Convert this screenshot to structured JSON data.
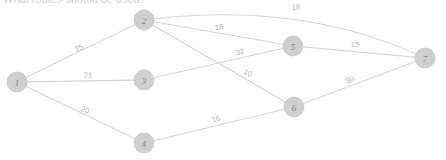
{
  "caption": {
    "text": "What routes should be used?"
  },
  "chart_data": {
    "type": "diagram",
    "subtype": "weighted-undirected-graph",
    "title": "",
    "xlabel": "",
    "ylabel": "",
    "node_radius": 10,
    "colors": {
      "node_fill": "#cfcfcf",
      "node_stroke": "#c6c6c6",
      "edge_stroke": "#d6d6d6",
      "node_label": "#8a8a8a",
      "edge_label": "#b4b4b4",
      "background": "#ffffff",
      "caption": "#d2d2d2"
    },
    "nodes": [
      {
        "id": "1",
        "label": "1",
        "x": 17,
        "y": 82
      },
      {
        "id": "2",
        "label": "2",
        "x": 144,
        "y": 20
      },
      {
        "id": "3",
        "label": "3",
        "x": 144,
        "y": 80
      },
      {
        "id": "4",
        "label": "4",
        "x": 144,
        "y": 143
      },
      {
        "id": "5",
        "label": "5",
        "x": 293,
        "y": 46
      },
      {
        "id": "6",
        "label": "6",
        "x": 294,
        "y": 107
      },
      {
        "id": "7",
        "label": "7",
        "x": 425,
        "y": 58
      }
    ],
    "edges": [
      {
        "from": "1",
        "to": "2",
        "weight": 25,
        "label": "25",
        "curved": false,
        "label_x": 79,
        "label_y": 48,
        "label_rot": -26
      },
      {
        "from": "1",
        "to": "3",
        "weight": 21,
        "label": "21",
        "curved": false,
        "label_x": 88,
        "label_y": 75,
        "label_rot": -1
      },
      {
        "from": "1",
        "to": "4",
        "weight": 20,
        "label": "20",
        "curved": false,
        "label_x": 85,
        "label_y": 110,
        "label_rot": 25
      },
      {
        "from": "2",
        "to": "5",
        "weight": 18,
        "label": "18",
        "curved": false,
        "label_x": 219,
        "label_y": 27,
        "label_rot": -10
      },
      {
        "from": "2",
        "to": "7",
        "weight": 18,
        "label": "18",
        "curved": true,
        "label_x": 296,
        "label_y": 7,
        "label_rot": -3
      },
      {
        "from": "2",
        "to": "6",
        "weight": 10,
        "label": "10",
        "curved": false,
        "label_x": 248,
        "label_y": 73,
        "label_rot": 28
      },
      {
        "from": "3",
        "to": "5",
        "weight": 32,
        "label": "32",
        "curved": false,
        "label_x": 240,
        "label_y": 52,
        "label_rot": -14
      },
      {
        "from": "4",
        "to": "6",
        "weight": 16,
        "label": "16",
        "curved": false,
        "label_x": 216,
        "label_y": 119,
        "label_rot": -14
      },
      {
        "from": "5",
        "to": "7",
        "weight": 15,
        "label": "15",
        "curved": false,
        "label_x": 355,
        "label_y": 44,
        "label_rot": 0
      },
      {
        "from": "6",
        "to": "7",
        "weight": 30,
        "label": "30",
        "curved": false,
        "label_x": 350,
        "label_y": 80,
        "label_rot": -20
      }
    ],
    "curve_control": {
      "from": "2",
      "to": "7",
      "cx": 300,
      "cy": 2
    }
  }
}
